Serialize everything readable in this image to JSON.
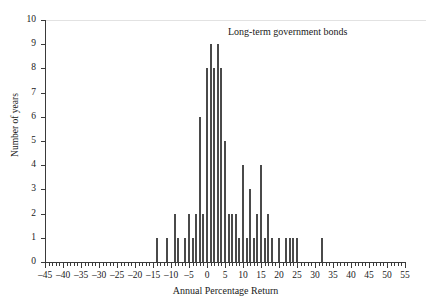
{
  "chart_data": {
    "type": "bar",
    "title": "",
    "annotation": "Long-term government bonds",
    "xlabel": "Annual Percentage Return",
    "ylabel": "Number of years",
    "xlim": [
      -45,
      55
    ],
    "ylim": [
      0,
      10
    ],
    "grid": false,
    "legend_position": "none",
    "x_major_ticks": [
      -45,
      -40,
      -35,
      -30,
      -25,
      -20,
      -15,
      -10,
      -5,
      0,
      5,
      10,
      15,
      20,
      25,
      30,
      35,
      40,
      45,
      50,
      55
    ],
    "x_major_tick_labels": [
      "–45",
      "–40",
      "–35",
      "–30",
      "–25",
      "–20",
      "–15",
      "–10",
      "–5",
      "0",
      "5",
      "10",
      "15",
      "20",
      "25",
      "30",
      "35",
      "40",
      "45",
      "50",
      "55"
    ],
    "x_minor_tick_step": 1,
    "y_ticks": [
      0,
      1,
      2,
      3,
      4,
      5,
      6,
      7,
      8,
      9,
      10
    ],
    "y_tick_labels": [
      "0",
      "1",
      "2",
      "3",
      "4",
      "5",
      "6",
      "7",
      "8",
      "9",
      "10"
    ],
    "bar_color": "#4a4a4a",
    "x": [
      -14,
      -11,
      -9,
      -8,
      -6,
      -5,
      -4,
      -3,
      -2,
      -1,
      0,
      1,
      2,
      3,
      4,
      5,
      6,
      7,
      8,
      9,
      10,
      11,
      12,
      13,
      14,
      15,
      16,
      17,
      18,
      20,
      22,
      23,
      24,
      25,
      32
    ],
    "values": [
      1,
      1,
      2,
      1,
      1,
      2,
      1,
      2,
      6,
      2,
      8,
      9,
      8,
      9,
      8,
      5,
      2,
      2,
      2,
      1,
      4,
      1,
      3,
      1,
      2,
      4,
      1,
      2,
      1,
      1,
      1,
      1,
      1,
      1,
      1
    ]
  },
  "figure": {
    "background_color": "#ffffff",
    "axis_color": "#3a3a3a"
  }
}
